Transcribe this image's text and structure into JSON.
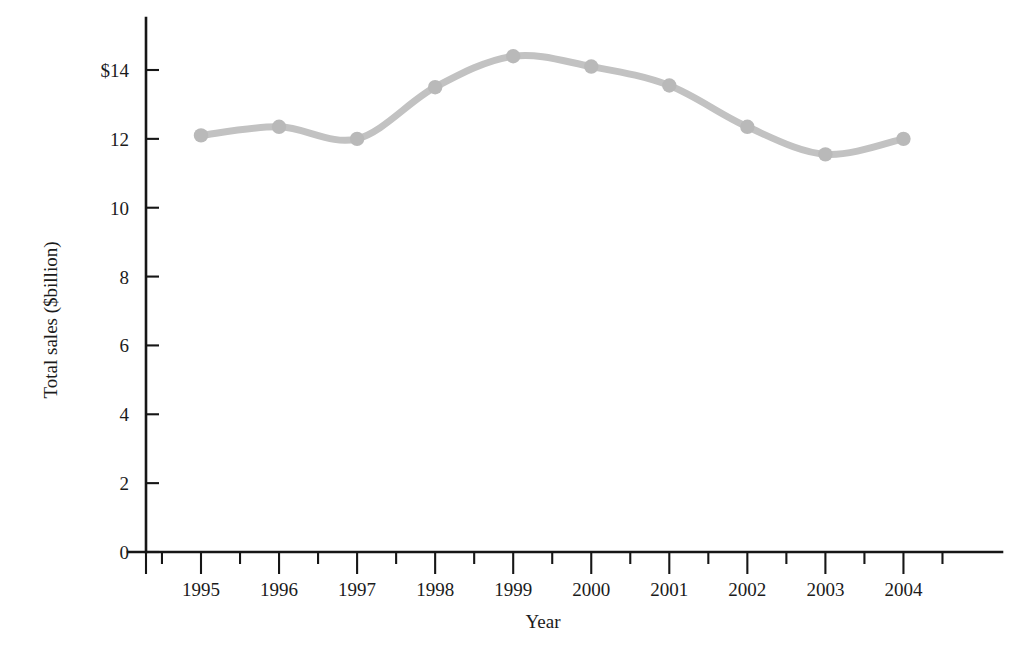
{
  "chart_data": {
    "type": "line",
    "title": "",
    "subtitle": "",
    "xlabel": "Year",
    "ylabel": "Total sales ($billion)",
    "categories": [
      "1995",
      "1996",
      "1997",
      "1998",
      "1999",
      "2000",
      "2001",
      "2002",
      "2003",
      "2004"
    ],
    "values": [
      12.1,
      12.35,
      12.0,
      13.5,
      14.4,
      14.1,
      13.55,
      12.35,
      11.55,
      12.0
    ],
    "series": [
      {
        "name": "Total sales",
        "values": [
          12.1,
          12.35,
          12.0,
          13.5,
          14.4,
          14.1,
          13.55,
          12.35,
          11.55,
          12.0
        ],
        "color": "#bfbfbf"
      }
    ],
    "xlim": [
      1994.5,
      2004.9
    ],
    "ylim": [
      0,
      14.8
    ],
    "y_ticks": [
      0,
      2,
      4,
      6,
      8,
      10,
      12,
      14
    ],
    "y_tick_labels": [
      "0",
      "2",
      "4",
      "6",
      "8",
      "10",
      "12",
      "$14"
    ],
    "x_tick_labels": [
      "1995",
      "1996",
      "1997",
      "1998",
      "1999",
      "2000",
      "2001",
      "2002",
      "2003",
      "2004"
    ],
    "grid": false,
    "legend": null,
    "legend_position": "none",
    "marker": "circle",
    "marker_color": "#b9b9b9",
    "line_color": "#c2c2c2",
    "line_width": 7,
    "axis_color": "#161616",
    "minor_x_ticks": true,
    "annotations": []
  },
  "axis": {
    "x_title": "Year",
    "y_title": "Total sales ($billion)"
  }
}
